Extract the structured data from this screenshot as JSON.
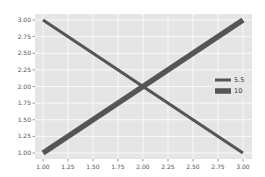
{
  "chart_data": {
    "type": "line",
    "title": "",
    "xlabel": "",
    "ylabel": "",
    "xlim": [
      0.9,
      3.1
    ],
    "ylim": [
      0.9,
      3.1
    ],
    "grid": true,
    "style": "ggplot",
    "legend_position": "center right",
    "x_ticks": [
      "1.00",
      "1.25",
      "1.50",
      "1.75",
      "2.00",
      "2.25",
      "2.50",
      "2.75",
      "3.00"
    ],
    "y_ticks": [
      "1.00",
      "1.25",
      "1.50",
      "1.75",
      "2.00",
      "2.25",
      "2.50",
      "2.75",
      "3.00"
    ],
    "series": [
      {
        "name": "5.5",
        "x": [
          1,
          2,
          3
        ],
        "y": [
          3,
          2,
          1
        ],
        "linewidth": 5.5,
        "color": "#555555"
      },
      {
        "name": "10",
        "x": [
          1,
          2,
          3
        ],
        "y": [
          1,
          2,
          3
        ],
        "linewidth": 10,
        "color": "#555555"
      }
    ]
  },
  "colors": {
    "plot_bg": "#e5e5e5",
    "grid": "#ffffff",
    "line": "#555555",
    "tick_text": "#555555"
  }
}
